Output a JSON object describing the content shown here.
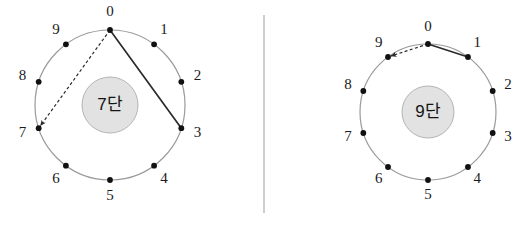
{
  "figure": {
    "background_color": "#ffffff",
    "divider": {
      "name": "vertical-divider",
      "x": 264,
      "y1": 15,
      "y2": 213,
      "color": "#b9b9b9"
    },
    "style": {
      "ring_color": "#9a9a9a",
      "hub_fill": "#e2e2e2",
      "hub_stroke": "#b4b4b4",
      "dot_color": "#111111",
      "solid_chord_color": "#2b2b2b",
      "dashed_chord_color": "#2b2b2b"
    },
    "panels": [
      {
        "id": "panel-left",
        "hub_label": "7단",
        "center": {
          "x": 110,
          "y": 105
        },
        "radius": 75,
        "hub_radius": 28,
        "label_offset": 17,
        "node_count": 10,
        "nodes": [
          {
            "value": "0",
            "angle_deg": -90
          },
          {
            "value": "1",
            "angle_deg": -54
          },
          {
            "value": "2",
            "angle_deg": -18
          },
          {
            "value": "3",
            "angle_deg": 18
          },
          {
            "value": "4",
            "angle_deg": 54
          },
          {
            "value": "5",
            "angle_deg": 90
          },
          {
            "value": "6",
            "angle_deg": 126
          },
          {
            "value": "7",
            "angle_deg": 162
          },
          {
            "value": "8",
            "angle_deg": 198
          },
          {
            "value": "9",
            "angle_deg": 234
          }
        ],
        "chords": [
          {
            "name": "chord-0-to-3",
            "from": 0,
            "to": 3,
            "style": "solid",
            "arrow": false
          },
          {
            "name": "chord-0-to-7",
            "from": 0,
            "to": 7,
            "style": "dashed",
            "arrow": true
          }
        ]
      },
      {
        "id": "panel-right",
        "hub_label": "9단",
        "center": {
          "x": 428,
          "y": 112
        },
        "radius": 68,
        "hub_radius": 26,
        "label_offset": 16,
        "node_count": 10,
        "nodes": [
          {
            "value": "0",
            "angle_deg": -90
          },
          {
            "value": "1",
            "angle_deg": -54
          },
          {
            "value": "2",
            "angle_deg": -18
          },
          {
            "value": "3",
            "angle_deg": 18
          },
          {
            "value": "4",
            "angle_deg": 54
          },
          {
            "value": "5",
            "angle_deg": 90
          },
          {
            "value": "6",
            "angle_deg": 126
          },
          {
            "value": "7",
            "angle_deg": 162
          },
          {
            "value": "8",
            "angle_deg": 198
          },
          {
            "value": "9",
            "angle_deg": 234
          }
        ],
        "chords": [
          {
            "name": "chord-0-to-1",
            "from": 0,
            "to": 1,
            "style": "solid",
            "arrow": false
          },
          {
            "name": "chord-0-to-9",
            "from": 0,
            "to": 9,
            "style": "dashed",
            "arrow": true
          }
        ]
      }
    ]
  }
}
